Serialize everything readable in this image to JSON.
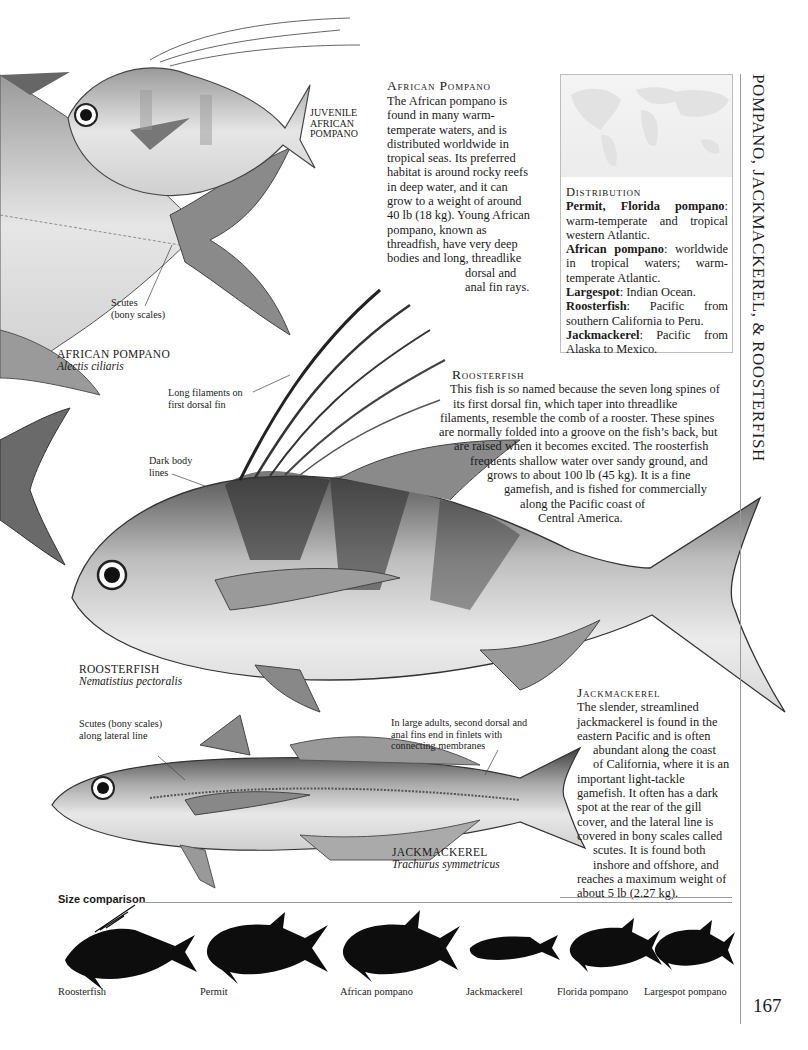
{
  "page": {
    "running_title": "POMPANO, JACKMACKEREL, & ROOSTERFISH",
    "page_number": "167"
  },
  "african_pompano": {
    "heading": "African Pompano",
    "body": [
      "The African pompano is",
      "found in many warm-",
      "temperate waters, and is",
      "distributed worldwide in",
      "tropical seas. Its preferred",
      "habitat is around rocky reefs",
      "in deep water, and it can",
      "grow to a weight of around",
      "40 lb (18 kg). Young African",
      "pompano, known as",
      "threadfish, have very deep",
      "bodies and long, threadlike",
      "dorsal and",
      "anal fin rays."
    ],
    "juvenile_label": [
      "JUVENILE",
      "AFRICAN",
      "POMPANO"
    ],
    "scutes_label": [
      "Scutes",
      "(bony scales)"
    ],
    "caption_common": "AFRICAN POMPANO",
    "caption_scientific": "Alectis ciliaris"
  },
  "distribution": {
    "heading": "Distribution",
    "entries": [
      {
        "name": "Permit, Florida pompano",
        "text": ": warm-temperate and tropical western Atlantic."
      },
      {
        "name": "African pompano",
        "text": ": worldwide in tropical waters; warm-temperate Atlantic."
      },
      {
        "name": "Largespot",
        "text": ": Indian Ocean."
      },
      {
        "name": "Roosterfish",
        "text": ": Pacific from southern California to Peru."
      },
      {
        "name": "Jackmackerel",
        "text": ": Pacific from Alaska to Mexico."
      }
    ]
  },
  "roosterfish": {
    "heading": "Roosterfish",
    "body": [
      "This fish is so named because the seven long spines of",
      "its first dorsal fin, which taper into threadlike",
      "filaments, resemble the comb of a rooster. These spines",
      "are normally folded into a groove on the fish’s back, but",
      "are raised when it becomes excited. The roosterfish",
      "frequents shallow water over sandy ground, and",
      "grows to about 100 lb (45 kg). It is a fine",
      "gamefish, and is fished for commercially",
      "along the Pacific coast of",
      "Central America."
    ],
    "filaments_label": [
      "Long filaments on",
      "first dorsal fin"
    ],
    "body_lines_label": [
      "Dark body",
      "lines"
    ],
    "caption_common": "ROOSTERFISH",
    "caption_scientific": "Nematistius pectoralis"
  },
  "jackmackerel": {
    "heading": "Jackmackerel",
    "body": [
      "The slender, streamlined",
      "jackmackerel is found in the",
      "eastern Pacific and is often",
      "abundant along the coast",
      "of California, where it is an",
      "important light-tackle",
      "gamefish. It often has a dark",
      "spot at the rear of the gill",
      "cover, and the lateral line is",
      "covered in bony scales called",
      "scutes. It is found both",
      "inshore and offshore, and",
      "reaches a maximum weight of",
      "about 5 lb (2.27 kg)."
    ],
    "scutes_label": [
      "Scutes (bony scales)",
      "along lateral line"
    ],
    "finlets_label": [
      "In large adults, second dorsal and",
      "anal fins end in finlets with",
      "connecting membranes"
    ],
    "caption_common": "JACKMACKEREL",
    "caption_scientific": "Trachurus symmetricus"
  },
  "size_comparison": {
    "heading": "Size comparison",
    "fish": [
      {
        "label": "Roosterfish",
        "icon": "roosterfish-silhouette"
      },
      {
        "label": "Permit",
        "icon": "permit-silhouette"
      },
      {
        "label": "African pompano",
        "icon": "african-pompano-silhouette"
      },
      {
        "label": "Jackmackerel",
        "icon": "jackmackerel-silhouette"
      },
      {
        "label": "Florida pompano",
        "icon": "florida-pompano-silhouette"
      },
      {
        "label": "Largespot pompano",
        "icon": "largespot-pompano-silhouette"
      }
    ]
  },
  "colors": {
    "ink": "#1a1a1a",
    "rule": "#9a9a9a",
    "map": "#ececec",
    "silhouette": "#0d0d0d"
  }
}
